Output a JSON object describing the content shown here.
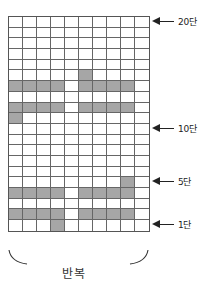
{
  "diagram": {
    "type": "knitting-chart",
    "columns": 10,
    "rows": 20,
    "row_order": "top row is 단 20, bottom row is 단 1",
    "filled_cells": [
      {
        "row": 15,
        "cols": [
          5
        ]
      },
      {
        "row": 14,
        "cols": [
          0,
          1,
          2,
          3,
          5,
          6,
          7,
          8
        ]
      },
      {
        "row": 12,
        "cols": [
          0,
          1,
          2,
          3,
          5,
          6,
          7,
          8
        ]
      },
      {
        "row": 11,
        "cols": [
          0
        ]
      },
      {
        "row": 5,
        "cols": [
          8
        ]
      },
      {
        "row": 4,
        "cols": [
          0,
          1,
          2,
          3,
          5,
          6,
          7,
          8
        ]
      },
      {
        "row": 2,
        "cols": [
          0,
          1,
          2,
          3,
          5,
          6,
          7,
          8
        ]
      },
      {
        "row": 1,
        "cols": [
          3
        ]
      }
    ],
    "colors": {
      "filled": "#a6a6a6",
      "empty": "#ffffff",
      "grid_line": "#555555"
    }
  },
  "labels": [
    {
      "row": 20,
      "text": "20단"
    },
    {
      "row": 10,
      "text": "10단"
    },
    {
      "row": 5,
      "text": "5단"
    },
    {
      "row": 1,
      "text": "1단"
    }
  ],
  "bracket": {
    "text": "반복"
  }
}
